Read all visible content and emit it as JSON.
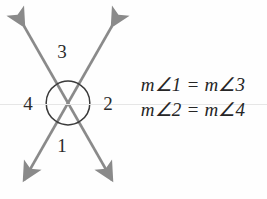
{
  "figure": {
    "type": "geometry-diagram",
    "background_color": "#fefefe",
    "line_color": "#8a8a8a",
    "arc_color": "#3a3a3a",
    "text_color": "#262626"
  },
  "labels": {
    "angle_top": "3",
    "angle_left": "4",
    "angle_right": "2",
    "angle_bottom": "1"
  },
  "equations": [
    "m∠1 = m∠3",
    "m∠2 = m∠4"
  ],
  "geometry": {
    "intersection": {
      "x": 68,
      "y": 103
    },
    "arc_radius": 22,
    "line_a": {
      "x1": 18,
      "y1": 22,
      "x2": 118,
      "y2": 184,
      "arrows": "both"
    },
    "line_b": {
      "x1": 118,
      "y1": 22,
      "x2": 18,
      "y2": 184,
      "arrows": "both"
    }
  }
}
